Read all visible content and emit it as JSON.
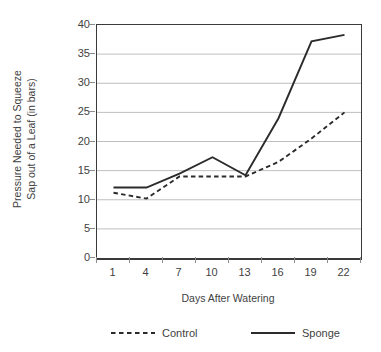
{
  "chart_data": {
    "type": "line",
    "title": "",
    "xlabel": "Days After Watering",
    "ylabel": "Pressure Needed to Squeeze Sap out of a Leaf (in bars)",
    "ylabel_lines": [
      "Pressure Needed to Squeeze",
      "Sap out of a Leaf (in bars)"
    ],
    "categories": [
      "1",
      "4",
      "7",
      "10",
      "13",
      "16",
      "19",
      "22"
    ],
    "x": [
      1,
      4,
      7,
      10,
      13,
      16,
      19,
      22
    ],
    "ylim": [
      0,
      40
    ],
    "yticks": [
      0,
      5,
      10,
      15,
      20,
      25,
      30,
      35,
      40
    ],
    "ytick_labels": [
      "0",
      "5",
      "10",
      "15",
      "20",
      "25",
      "30",
      "35",
      "40"
    ],
    "grid": "horizontal",
    "legend_position": "bottom",
    "series": [
      {
        "name": "Control",
        "style": "dashed",
        "color": "#2b2b2b",
        "values": [
          11.2,
          10.2,
          14.0,
          14.0,
          14.0,
          16.5,
          20.5,
          25.0
        ]
      },
      {
        "name": "Sponge",
        "style": "solid",
        "color": "#2b2b2b",
        "values": [
          12.1,
          12.1,
          14.5,
          17.3,
          14.2,
          24.0,
          37.2,
          38.3
        ]
      }
    ]
  },
  "legend": {
    "items": [
      {
        "label": "Control",
        "style": "dashed"
      },
      {
        "label": "Sponge",
        "style": "solid"
      }
    ]
  },
  "colors": {
    "axis": "#3a3a3a",
    "grid": "#bfbfbf",
    "line": "#2b2b2b",
    "text": "#3f3f3f",
    "background": "#ffffff"
  }
}
